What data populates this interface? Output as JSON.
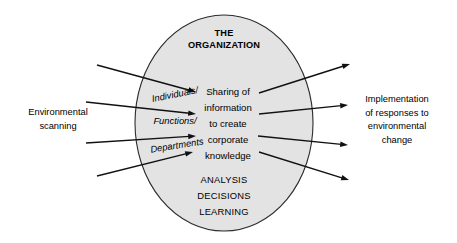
{
  "diagram": {
    "kind": "organization-information-flow",
    "canvas": {
      "width": 457,
      "height": 243,
      "background": "#ffffff"
    },
    "colors": {
      "ellipse_fill": "#e3e3e3",
      "ellipse_stroke": "#2b2b2b",
      "arrow": "#111111",
      "text": "#000000"
    },
    "ellipse": {
      "cx": 224,
      "cy": 123,
      "rx": 89,
      "ry": 108
    },
    "title": {
      "lines": [
        "THE",
        "ORGANIZATION"
      ],
      "x": 224,
      "y_start": 34,
      "line_height": 11.5
    },
    "core_process": {
      "lines": [
        "Sharing of",
        "information",
        "to create",
        "corporate",
        "knowledge"
      ],
      "x": 228,
      "y_start": 92,
      "line_height": 16.2
    },
    "outcomes": {
      "lines": [
        "ANALYSIS",
        "DECISIONS",
        "LEARNING"
      ],
      "x": 224,
      "y_start": 181,
      "line_height": 15.6
    },
    "input_label": {
      "lines": [
        "Environmental",
        "scanning"
      ],
      "x": 58,
      "y_start": 113,
      "line_height": 13.2
    },
    "output_label": {
      "lines": [
        "Implementation",
        "of responses to",
        "environmental",
        "change"
      ],
      "x": 397,
      "y_start": 100,
      "line_height": 13.4
    },
    "channels": [
      {
        "id": "channel-individuals",
        "label": "Individuals/",
        "x": 175,
        "y": 95,
        "rotate": -11
      },
      {
        "id": "channel-functions",
        "label": "Functions/",
        "x": 175,
        "y": 122,
        "rotate": 0
      },
      {
        "id": "channel-departments",
        "label": "Departments",
        "x": 177,
        "y": 146,
        "rotate": -9
      }
    ],
    "input_arrows": [
      {
        "id": "input-arrow-1",
        "x1": 97,
        "y1": 65,
        "x2": 196,
        "y2": 92
      },
      {
        "id": "input-arrow-2",
        "x1": 86,
        "y1": 102,
        "x2": 196,
        "y2": 114
      },
      {
        "id": "input-arrow-3",
        "x1": 86,
        "y1": 143,
        "x2": 196,
        "y2": 136
      },
      {
        "id": "input-arrow-4",
        "x1": 97,
        "y1": 176,
        "x2": 193,
        "y2": 152
      }
    ],
    "output_arrows": [
      {
        "id": "output-arrow-1",
        "x1": 259,
        "y1": 93,
        "x2": 350,
        "y2": 64
      },
      {
        "id": "output-arrow-2",
        "x1": 259,
        "y1": 114,
        "x2": 348,
        "y2": 105
      },
      {
        "id": "output-arrow-3",
        "x1": 258,
        "y1": 136,
        "x2": 348,
        "y2": 145
      },
      {
        "id": "output-arrow-4",
        "x1": 259,
        "y1": 152,
        "x2": 349,
        "y2": 180
      }
    ]
  }
}
